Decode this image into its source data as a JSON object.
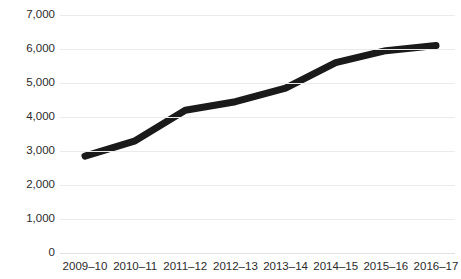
{
  "chart_data": {
    "type": "line",
    "title": "",
    "xlabel": "",
    "ylabel": "",
    "categories": [
      "2009–10",
      "2010–11",
      "2011–12",
      "2012–13",
      "2013–14",
      "2014–15",
      "2015–16",
      "2016–17"
    ],
    "values": [
      2850,
      3300,
      4200,
      4450,
      4850,
      5600,
      5950,
      6100
    ],
    "series": [
      {
        "name": "",
        "values": [
          2850,
          3300,
          4200,
          4450,
          4850,
          5600,
          5950,
          6100
        ]
      }
    ],
    "ylim": [
      0,
      8000
    ],
    "ytick_values": [
      0,
      1000,
      2000,
      3000,
      4000,
      5000,
      6000,
      7000,
      8000
    ],
    "ytick_labels": [
      "0",
      "1,000",
      "2,000",
      "3,000",
      "4,000",
      "5,000",
      "6,000",
      "7,000",
      "8,000"
    ],
    "grid": true,
    "grid_axis": "y",
    "legend": "none",
    "markers": false,
    "line_color": "#1a1a1a",
    "grid_color": "#ebebeb",
    "background_color": "#ffffff",
    "text_color": "#2b2b2b",
    "top_label_clipped": "8,000"
  }
}
